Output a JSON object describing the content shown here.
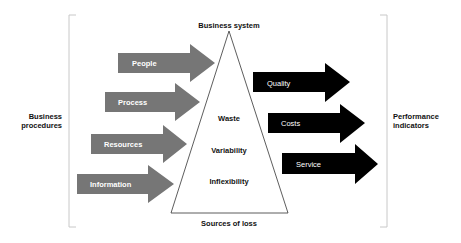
{
  "diagram": {
    "top_label": "Business system",
    "bottom_label": "Sources of loss",
    "left_label": "Business procedures",
    "left_label_lines": [
      "Business",
      "procedures"
    ],
    "right_label_lines": [
      "Performance",
      "indicators"
    ],
    "triangle_items": [
      "Waste",
      "Variability",
      "Inflexibility"
    ],
    "input_arrows": [
      {
        "label": "People",
        "color": "#767676"
      },
      {
        "label": "Process",
        "color": "#767676"
      },
      {
        "label": "Resources",
        "color": "#767676"
      },
      {
        "label": "Information",
        "color": "#767676"
      }
    ],
    "output_arrows": [
      {
        "label": "Quality",
        "color": "#000000"
      },
      {
        "label": "Costs",
        "color": "#000000"
      },
      {
        "label": "Service",
        "color": "#000000"
      }
    ],
    "bracket_color": "#c8c8c8",
    "triangle_stroke": "#333333"
  }
}
